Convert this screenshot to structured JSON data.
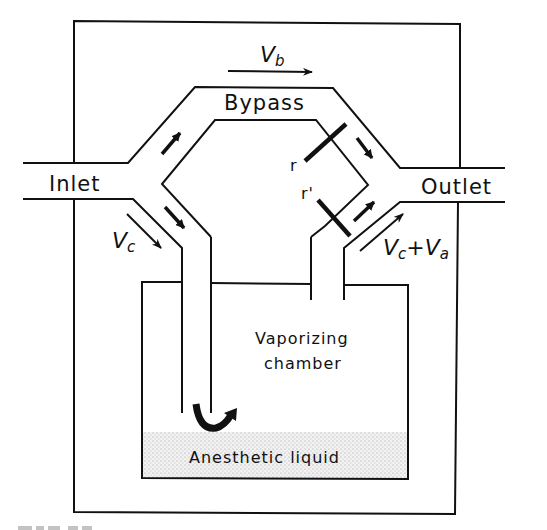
{
  "figure": {
    "caption_partial": "FIG. 7-2",
    "labels": {
      "inlet": "Inlet",
      "outlet": "Outlet",
      "bypass": "Bypass",
      "vaporizing_chamber_line1": "Vaporizing",
      "vaporizing_chamber_line2": "chamber",
      "anesthetic_liquid": "Anesthetic liquid",
      "resistor_r": "r",
      "resistor_r_prime": "r'"
    },
    "flow_labels": {
      "bypass_flow": {
        "main": "V",
        "sub": "b"
      },
      "chamber_flow": {
        "main": "V",
        "sub": "c"
      },
      "outlet_flow": {
        "main1": "V",
        "sub1": "c",
        "plus": "+",
        "main2": "V",
        "sub2": "a"
      }
    },
    "colors": {
      "stroke": "#111111",
      "background": "#ffffff",
      "liquid_fill": "#e4e4e4"
    }
  }
}
